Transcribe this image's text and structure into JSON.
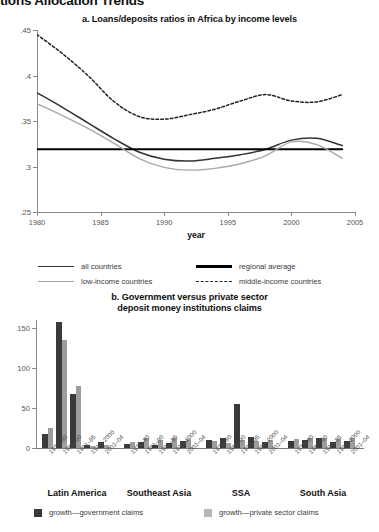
{
  "page": {
    "heading": "tions Allocation Trends"
  },
  "panel_a": {
    "title": "a. Loans/deposits ratios in Africa by income levels",
    "legend": [
      {
        "label": "all countries",
        "style": "solid-dark",
        "color": "#333333"
      },
      {
        "label": "regional average",
        "style": "solid-thick-black",
        "color": "#000000"
      },
      {
        "label": "low-income countries",
        "style": "solid-gray",
        "color": "#a8a8a8"
      },
      {
        "label": "middle-income countries",
        "style": "dashed-black",
        "color": "#222222"
      }
    ]
  },
  "panel_b": {
    "title_line1": "b. Government versus private sector",
    "title_line2": "deposit money institutions claims",
    "legend": [
      {
        "label": "growth—government claims",
        "color": "#3a3a3a"
      },
      {
        "label": "growth—private sector claims",
        "color": "#b5b5b5"
      }
    ]
  },
  "chart_data": [
    {
      "type": "line",
      "title": "a. Loans/deposits ratios in Africa by income levels",
      "xlabel": "year",
      "ylabel": "",
      "xlim": [
        1980,
        2005
      ],
      "ylim": [
        0.25,
        0.45
      ],
      "xticks": [
        1980,
        1985,
        1990,
        1995,
        2000,
        2005
      ],
      "xticklabels": [
        "1980",
        "1985",
        "1990",
        "1995",
        "2000",
        "2005"
      ],
      "yticks": [
        0.25,
        0.3,
        0.35,
        0.4,
        0.45
      ],
      "yticklabels": [
        ".25",
        ".3",
        ".35",
        ".4",
        ".45"
      ],
      "grid": false,
      "legend_position": "below",
      "series": [
        {
          "name": "all countries",
          "style": "solid",
          "color": "#333333",
          "x": [
            1980,
            1982,
            1984,
            1986,
            1988,
            1990,
            1992,
            1994,
            1996,
            1998,
            2000,
            2002,
            2004
          ],
          "values": [
            0.381,
            0.365,
            0.348,
            0.331,
            0.316,
            0.308,
            0.306,
            0.309,
            0.313,
            0.319,
            0.329,
            0.331,
            0.323
          ]
        },
        {
          "name": "regional average",
          "style": "solid-thick",
          "color": "#000000",
          "x": [
            1980,
            2004
          ],
          "values": [
            0.319,
            0.319
          ]
        },
        {
          "name": "low-income countries",
          "style": "solid",
          "color": "#a8a8a8",
          "x": [
            1980,
            1982,
            1984,
            1986,
            1988,
            1990,
            1992,
            1994,
            1996,
            1998,
            2000,
            2002,
            2004
          ],
          "values": [
            0.369,
            0.356,
            0.342,
            0.326,
            0.309,
            0.299,
            0.296,
            0.298,
            0.303,
            0.312,
            0.327,
            0.324,
            0.309
          ]
        },
        {
          "name": "middle-income countries",
          "style": "dashed",
          "color": "#222222",
          "x": [
            1980,
            1982,
            1984,
            1986,
            1988,
            1990,
            1992,
            1994,
            1996,
            1998,
            2000,
            2002,
            2004
          ],
          "values": [
            0.445,
            0.424,
            0.4,
            0.372,
            0.355,
            0.352,
            0.357,
            0.363,
            0.372,
            0.379,
            0.372,
            0.371,
            0.379
          ]
        }
      ]
    },
    {
      "type": "bar",
      "title": "b. Government versus private sector deposit money institutions claims",
      "xlabel": "",
      "ylabel": "",
      "ylim": [
        0,
        160
      ],
      "yticks": [
        0,
        50,
        100,
        150
      ],
      "yticklabels": [
        "0",
        "50",
        "100",
        "150"
      ],
      "grid": false,
      "legend_position": "below",
      "periods": [
        "1971–80",
        "1981–90",
        "1991–95",
        "1996–2000",
        "2001–04"
      ],
      "groups": [
        {
          "region": "Latin America",
          "government_claims": [
            17,
            157,
            68,
            4,
            7
          ],
          "private_sector_claims": [
            25,
            135,
            78,
            3,
            4
          ]
        },
        {
          "region": "Southeast Asia",
          "government_claims": [
            5,
            7,
            4,
            6,
            9
          ],
          "private_sector_claims": [
            8,
            12,
            10,
            12,
            11
          ]
        },
        {
          "region": "SSA",
          "government_claims": [
            10,
            13,
            55,
            14,
            8
          ],
          "private_sector_claims": [
            9,
            6,
            10,
            9,
            10
          ]
        },
        {
          "region": "South Asia",
          "government_claims": [
            9,
            10,
            13,
            8,
            9
          ],
          "private_sector_claims": [
            11,
            12,
            12,
            11,
            12
          ]
        }
      ],
      "series": [
        {
          "name": "growth—government claims",
          "color": "#3a3a3a"
        },
        {
          "name": "growth—private sector claims",
          "color": "#9d9d9d"
        }
      ]
    }
  ]
}
